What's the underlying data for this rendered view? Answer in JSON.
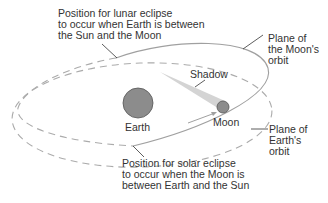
{
  "diagram": {
    "labels": {
      "lunar_eclipse": "Position for lunar eclipse\nto occur when Earth is between\nthe Sun and the Moon",
      "solar_eclipse": "Position for solar eclipse\nto occur when the Moon is\nbetween Earth and the Sun",
      "moon_orbit": "Plane of\nthe Moon's\norbit",
      "earth_orbit": "Plane of\nEarth's\norbit",
      "shadow": "Shadow",
      "earth": "Earth",
      "moon": "Moon"
    },
    "colors": {
      "orbit_line": "#a8a8a8",
      "earth_fill": "#8a8a8a",
      "moon_fill": "#8a8a8a",
      "shadow_fill": "#d4d4d4",
      "text": "#333333",
      "leader_line": "#333333"
    }
  }
}
